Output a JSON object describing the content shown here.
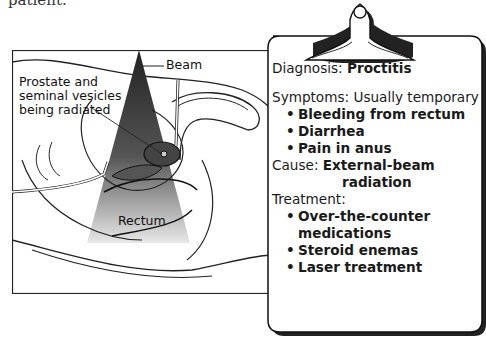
{
  "page": {
    "partial_top_text": "patient."
  },
  "illustration": {
    "labels": {
      "beam": "Beam",
      "prostate": [
        "Prostate and",
        "seminal vesicles",
        "being radiated"
      ],
      "rectum": "Rectum"
    }
  },
  "clipboard": {
    "diagnosis": {
      "label": "Diagnosis:",
      "value": "Proctitis"
    },
    "symptoms": {
      "label": "Symptoms:",
      "value": "Usually temporary",
      "items": [
        "Bleeding from rectum",
        "Diarrhea",
        "Pain in anus"
      ]
    },
    "cause": {
      "label": "Cause:",
      "value_line1": "External-beam",
      "value_line2": "radiation"
    },
    "treatment": {
      "label": "Treatment:",
      "items": [
        "Over-the-counter",
        "medications",
        "Steroid enemas",
        "Laser treatment"
      ]
    }
  },
  "colors": {
    "ink": "#1a1a1a",
    "beam_dark": "#2a2a2a",
    "beam_light": "#e0e0e0",
    "paper": "#ffffff"
  }
}
